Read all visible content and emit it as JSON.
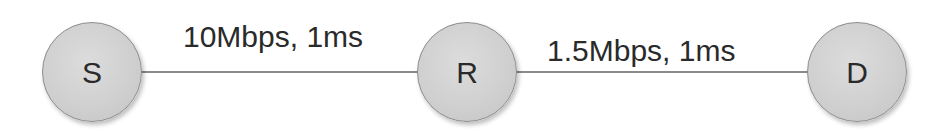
{
  "diagram": {
    "type": "network-topology",
    "nodes": [
      {
        "id": "S",
        "label": "S"
      },
      {
        "id": "R",
        "label": "R"
      },
      {
        "id": "D",
        "label": "D"
      }
    ],
    "links": [
      {
        "from": "S",
        "to": "R",
        "label": "10Mbps, 1ms",
        "bandwidth": "10Mbps",
        "delay": "1ms"
      },
      {
        "from": "R",
        "to": "D",
        "label": "1.5Mbps, 1ms",
        "bandwidth": "1.5Mbps",
        "delay": "1ms"
      }
    ],
    "colors": {
      "node_fill": "#d0d0d0",
      "node_border": "#8c8c8c",
      "link": "#8a8a8a",
      "text": "#2a2a2a"
    }
  }
}
